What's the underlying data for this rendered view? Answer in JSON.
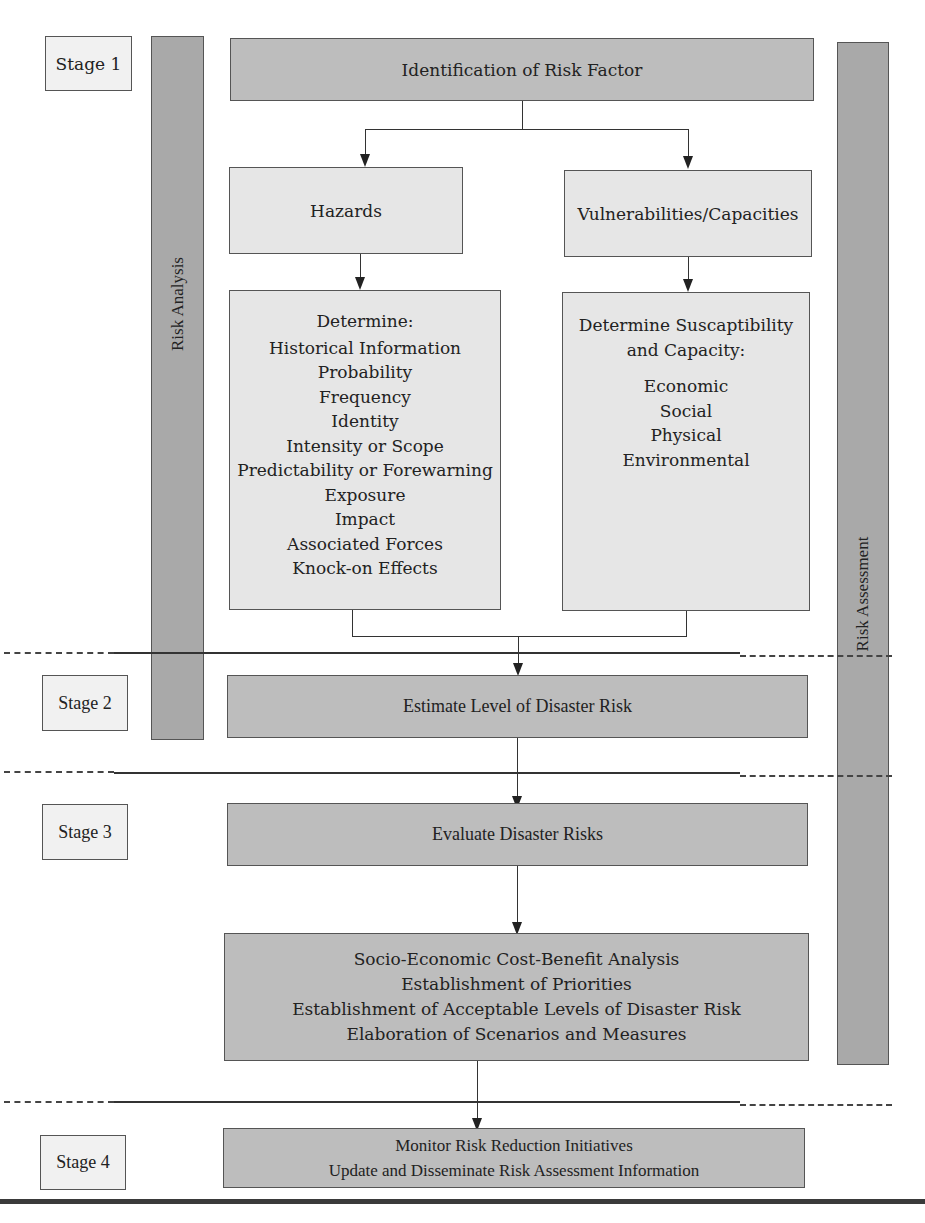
{
  "stages": [
    {
      "label": "Stage 1"
    },
    {
      "label": "Stage 2"
    },
    {
      "label": "Stage 3"
    },
    {
      "label": "Stage 4"
    }
  ],
  "side_bars": {
    "left": "Risk Analysis",
    "right": "Risk Assessment"
  },
  "boxes": {
    "identification": "Identification of Risk Factor",
    "hazards": "Hazards",
    "vulnerabilities": "Vulnerabilities/Capacities",
    "hazards_detail": {
      "heading": "Determine:",
      "items": [
        "Historical Information",
        "Probability",
        "Frequency",
        "Identity",
        "Intensity or Scope",
        "Predictability or Forewarning",
        "Exposure",
        "Impact",
        "Associated Forces",
        "Knock-on Effects"
      ]
    },
    "vulnerabilities_detail": {
      "heading_line1": "Determine Suscaptibility",
      "heading_line2": "and Capacity:",
      "items": [
        "Economic",
        "Social",
        "Physical",
        "Environmental"
      ]
    },
    "estimate": "Estimate Level of Disaster Risk",
    "evaluate": "Evaluate Disaster Risks",
    "analysis_list": [
      "Socio-Economic Cost-Benefit Analysis",
      "Establishment of Priorities",
      "Establishment of Acceptable Levels of Disaster Risk",
      "Elaboration of Scenarios and Measures"
    ],
    "monitor_lines": [
      "Monitor Risk Reduction Initiatives",
      "Update and Disseminate Risk Assessment Information"
    ]
  },
  "colors": {
    "dark_box": "#bdbdbd",
    "light_box": "#e6e6e6",
    "side_bar": "#a9a9a9",
    "stage_box": "#f1f1f1",
    "border": "#555555"
  }
}
